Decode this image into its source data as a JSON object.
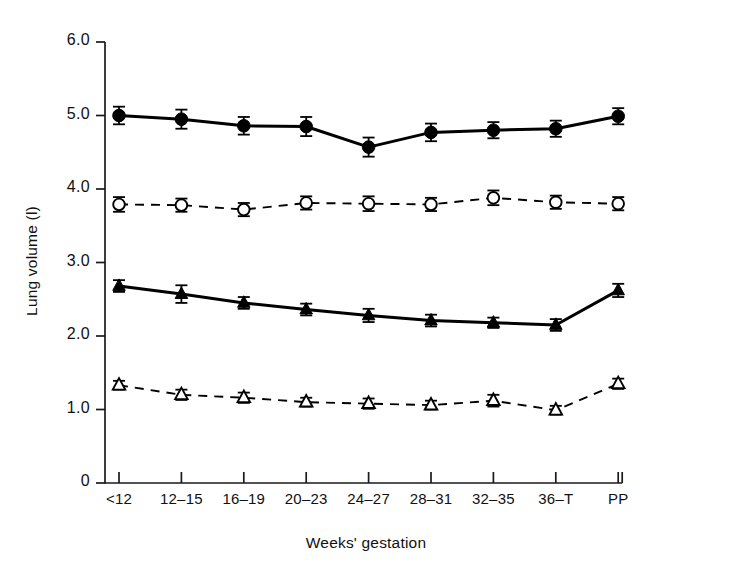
{
  "chart_data": {
    "type": "line",
    "title": "",
    "xlabel": "Weeks' gestation",
    "ylabel": "Lung volume (l)",
    "categories": [
      "<12",
      "12–15",
      "16–19",
      "20–23",
      "24–27",
      "28–31",
      "32–35",
      "36–T",
      "PP"
    ],
    "ytick_labels": [
      "6.0",
      "5.0",
      "4.0",
      "3.0",
      "2.0",
      "1.0",
      "0"
    ],
    "ytick_values": [
      6.0,
      5.0,
      4.0,
      3.0,
      2.0,
      1.0,
      0
    ],
    "ylim": [
      0,
      6.0
    ],
    "grid": false,
    "legend_position": "none",
    "error_bars": "standard error",
    "series": [
      {
        "name": "Total lung capacity",
        "marker": "filled-circle",
        "line_style": "solid",
        "color": "#000000",
        "values": [
          5.0,
          4.95,
          4.86,
          4.85,
          4.57,
          4.77,
          4.8,
          4.82,
          4.99
        ],
        "errors": [
          0.12,
          0.13,
          0.12,
          0.13,
          0.13,
          0.12,
          0.11,
          0.11,
          0.11
        ]
      },
      {
        "name": "Functional residual capacity",
        "marker": "open-circle",
        "line_style": "dashed",
        "color": "#000000",
        "values": [
          3.79,
          3.78,
          3.72,
          3.81,
          3.8,
          3.79,
          3.88,
          3.82,
          3.8
        ],
        "errors": [
          0.1,
          0.09,
          0.09,
          0.09,
          0.1,
          0.09,
          0.1,
          0.09,
          0.09
        ]
      },
      {
        "name": "Inspiratory capacity",
        "marker": "filled-triangle",
        "line_style": "solid",
        "color": "#000000",
        "values": [
          2.68,
          2.57,
          2.45,
          2.36,
          2.28,
          2.21,
          2.18,
          2.15,
          2.62
        ],
        "errors": [
          0.08,
          0.12,
          0.08,
          0.08,
          0.09,
          0.08,
          0.07,
          0.08,
          0.09
        ]
      },
      {
        "name": "Residual volume",
        "marker": "open-triangle",
        "line_style": "dashed",
        "color": "#000000",
        "values": [
          1.33,
          1.2,
          1.16,
          1.1,
          1.08,
          1.06,
          1.12,
          0.99,
          1.35
        ],
        "errors": [
          0.06,
          0.07,
          0.07,
          0.06,
          0.07,
          0.06,
          0.08,
          0.06,
          0.07
        ]
      }
    ]
  },
  "axes": {
    "y_title": "Lung volume (l)",
    "x_title": "Weeks' gestation"
  }
}
